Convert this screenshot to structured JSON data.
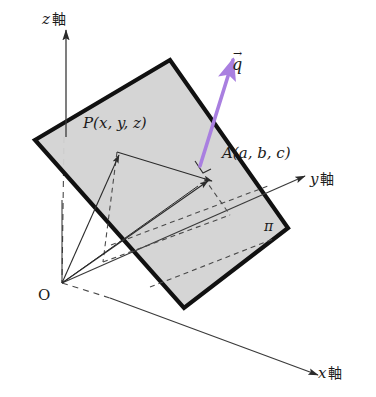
{
  "figure": {
    "background_color": "#ffffff",
    "plane_fill_color": "#d3d3d3",
    "plane_edge_color": "#111111",
    "axis_color": "#3a3a3a",
    "vector_color": "#a97fe0",
    "dashed_color": "#4a4a4a"
  },
  "labels": {
    "z_axis_var": "z",
    "z_axis_word": "軸",
    "y_axis_var": "y",
    "y_axis_word": "軸",
    "x_axis_var": "x",
    "x_axis_word": "軸",
    "origin": "O",
    "point_p": "P(x, y, z)",
    "point_a": "A(a, b, c)",
    "plane": "π",
    "vector_q": "q",
    "vector_q_arrow": "→"
  },
  "geometry": {
    "origin_px": [
      62,
      283
    ],
    "plane_corners_px": [
      [
        35,
        140
      ],
      [
        170,
        60
      ],
      [
        288,
        228
      ],
      [
        184,
        308
      ]
    ],
    "point_p_px": [
      117,
      152
    ],
    "point_a_px": [
      204,
      178
    ],
    "vector_q_tail_px": [
      200,
      163
    ],
    "vector_q_head_px": [
      235,
      55
    ],
    "z_axis_tip_px": [
      66,
      26
    ],
    "y_axis_tip_px": [
      305,
      176
    ],
    "x_axis_tip_px": [
      318,
      375
    ],
    "right_angle_marker_px": [
      200,
      163
    ]
  }
}
